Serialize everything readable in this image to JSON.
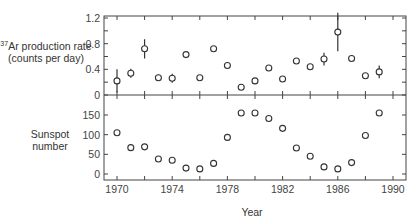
{
  "chart_data": [
    {
      "type": "scatter",
      "title": "",
      "ylabel": "37Ar production rate (counts per day)",
      "ylabel_sup": "37",
      "ylabel_main": "Ar production rate (counts per day)",
      "ylim": [
        0,
        1.2
      ],
      "yticks": [
        "0",
        "0.4",
        "0.8",
        "1.2"
      ],
      "x": [
        1970.0,
        1971.0,
        1972.0,
        1973.0,
        1974.0,
        1975.0,
        1976.0,
        1977.0,
        1978.0,
        1979.0,
        1980.0,
        1981.0,
        1982.0,
        1983.0,
        1984.0,
        1985.0,
        1986.0,
        1987.0,
        1988.0,
        1989.0
      ],
      "values": [
        0.22,
        0.34,
        0.72,
        0.27,
        0.26,
        0.63,
        0.27,
        0.72,
        0.46,
        0.12,
        0.22,
        0.42,
        0.25,
        0.53,
        0.44,
        0.56,
        0.98,
        0.57,
        0.3,
        0.36
      ],
      "err": [
        0.18,
        0.07,
        0.15,
        0.05,
        0.07,
        0,
        0,
        0,
        0,
        0,
        0,
        0,
        0,
        0,
        0,
        0.1,
        0.3,
        0,
        0,
        0.1
      ]
    },
    {
      "type": "scatter",
      "title": "",
      "ylabel": "Sunspot number",
      "ylim": [
        0,
        180
      ],
      "yticks": [
        "0",
        "50",
        "100",
        "150"
      ],
      "x": [
        1970.0,
        1971.0,
        1972.0,
        1973.0,
        1974.0,
        1975.0,
        1976.0,
        1977.0,
        1978.0,
        1979.0,
        1980.0,
        1981.0,
        1982.0,
        1983.0,
        1984.0,
        1985.0,
        1986.0,
        1987.0,
        1988.0,
        1989.0
      ],
      "values": [
        105,
        67,
        69,
        38,
        35,
        15,
        13,
        27,
        93,
        155,
        155,
        141,
        116,
        66,
        45,
        18,
        13,
        29,
        98,
        155
      ]
    }
  ],
  "xaxis": {
    "label": "Year",
    "ticks": [
      "1970",
      "1974",
      "1978",
      "1982",
      "1986",
      "1990"
    ]
  }
}
